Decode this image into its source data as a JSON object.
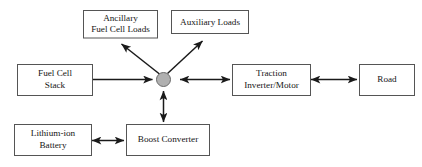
{
  "diagram": {
    "colors": {
      "box_fill": "#ffffff",
      "box_stroke": "#555555",
      "hub_fill": "#b0b0b0",
      "hub_stroke": "#6a6a6a",
      "arrow": "#1a1a1a",
      "text": "#161616",
      "background": "#ffffff"
    },
    "nodes": [
      {
        "id": "ancillary-fuel-cell-loads",
        "lines": [
          "Ancillary",
          "Fuel Cell Loads"
        ],
        "shape": "rect"
      },
      {
        "id": "auxiliary-loads",
        "lines": [
          "Auxiliary Loads"
        ],
        "shape": "rect"
      },
      {
        "id": "fuel-cell-stack",
        "lines": [
          "Fuel Cell",
          "Stack"
        ],
        "shape": "rect"
      },
      {
        "id": "traction-inverter-motor",
        "lines": [
          "Traction",
          "Inverter/Motor"
        ],
        "shape": "rect"
      },
      {
        "id": "road",
        "lines": [
          "Road"
        ],
        "shape": "rect"
      },
      {
        "id": "lithium-ion-battery",
        "lines": [
          "Lithium-ion",
          "Battery"
        ],
        "shape": "rect"
      },
      {
        "id": "boost-converter",
        "lines": [
          "Boost Converter"
        ],
        "shape": "rect"
      },
      {
        "id": "power-bus-junction",
        "lines": [],
        "shape": "circle"
      }
    ],
    "edges": [
      {
        "id": "fuel-cell-stack-to-junction",
        "from": "fuel-cell-stack",
        "to": "power-bus-junction",
        "arrows": "single"
      },
      {
        "id": "junction-to-ancillary-fuel-cell-loads",
        "from": "power-bus-junction",
        "to": "ancillary-fuel-cell-loads",
        "arrows": "single"
      },
      {
        "id": "junction-to-auxiliary-loads",
        "from": "power-bus-junction",
        "to": "auxiliary-loads",
        "arrows": "single"
      },
      {
        "id": "junction-to-traction-inverter-motor",
        "from": "power-bus-junction",
        "to": "traction-inverter-motor",
        "arrows": "double"
      },
      {
        "id": "traction-inverter-motor-to-road",
        "from": "traction-inverter-motor",
        "to": "road",
        "arrows": "double"
      },
      {
        "id": "junction-to-boost-converter",
        "from": "power-bus-junction",
        "to": "boost-converter",
        "arrows": "double"
      },
      {
        "id": "lithium-ion-battery-to-boost-converter",
        "from": "lithium-ion-battery",
        "to": "boost-converter",
        "arrows": "double"
      }
    ]
  }
}
